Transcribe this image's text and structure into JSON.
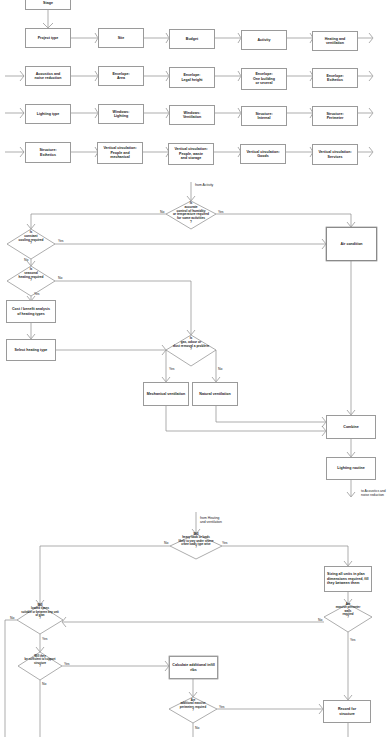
{
  "diagram": {
    "process_chain": {
      "top_box": "Stage",
      "row1": [
        "Project type",
        "Site",
        "Budget",
        "Activity",
        "Heating and\nventilation"
      ],
      "row2": [
        "Acoustics and\nnoise reduction",
        "Envelope:\nArea",
        "Envelope:\nLegal height",
        "Envelope:\nOne building\nor several",
        "Envelope:\nEsthetics"
      ],
      "row3": [
        "Lighting type",
        "Windows:\nLighting",
        "Windows:\nVentilation",
        "Structure:\nInternal",
        "Structure:\nPerimeter"
      ],
      "row4": [
        "Structure:\nEsthetics",
        "Vertical circulation:\nPeople and\nmechanical",
        "Vertical circulation:\nPeople, waste\nand storage",
        "Vertical circulation:\nGoods",
        "Vertical circulation:\nServices"
      ]
    },
    "heating_flow": {
      "entry_label": "from Activity",
      "decision_control": "Is\naccurate\ncontrol of humidity\nor temperature required\nfor some activities\n?",
      "decision_cooling": "Is\nconstant\ncooling required\n?",
      "decision_heating": "Is\nseasonal\nheating required\n?",
      "box_cost_analysis": "Cost / benefit analysis\nof heating types",
      "box_select_heating": "Select heating type",
      "decision_ventilation": "Is\ngas, odour or\ndust removal a problem\n?",
      "box_mechanical": "Mechanical ventilation",
      "box_natural": "Natural ventilation",
      "box_air_condition": "Air condition",
      "box_combine": "Combine",
      "box_lighting": "Lighting routine",
      "exit_label": "to Acoustics and\nnoise reduction",
      "yes": "Yes",
      "no": "No"
    },
    "structure_flow": {
      "entry_label": "from Heating\nand ventilation",
      "decision_top": "Will\nheavy loads or loads\nlikely to vary under severe\ncrane loads type arise\n?",
      "box_sizing": "Sizing all units in plan\ndimensions required, fill\nthey between them",
      "decision_perimeter": "Are\nmassive perimeter\nwalls\nrequired\n?",
      "decision_left": "Will\nloaded spans\nsuitable or between any unit\nof plan\n?",
      "decision_sufficient": "Will they\nbe sufficient to support\nstructure\n?",
      "box_calculate": "Calculate additional infill ribs",
      "decision_additional": "Are\nadditional massive\nperimeters required\n?",
      "box_record": "Record for\nstructure",
      "yes": "Yes",
      "no": "No"
    }
  }
}
